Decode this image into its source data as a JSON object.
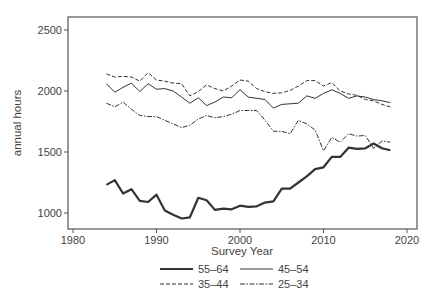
{
  "chart_data": {
    "type": "line",
    "title": "",
    "xlabel": "Survey Year",
    "ylabel": "annual hours",
    "xlim": [
      1979.4,
      2021.2
    ],
    "ylim": [
      900,
      2610
    ],
    "xticks": [
      1980,
      1990,
      2000,
      2010,
      2020
    ],
    "yticks": [
      1000,
      1500,
      2000,
      2500
    ],
    "grid": false,
    "legend_position": "bottom",
    "x": [
      1984,
      1985,
      1986,
      1987,
      1988,
      1989,
      1990,
      1991,
      1992,
      1993,
      1994,
      1995,
      1996,
      1997,
      1998,
      1999,
      2000,
      2001,
      2002,
      2003,
      2004,
      2005,
      2006,
      2007,
      2008,
      2009,
      2010,
      2011,
      2012,
      2013,
      2014,
      2015,
      2016,
      2017,
      2018
    ],
    "series": [
      {
        "name": "55–64",
        "style": "solid-thick",
        "values": [
          1230,
          1270,
          1160,
          1195,
          1100,
          1090,
          1150,
          1020,
          985,
          955,
          965,
          1125,
          1105,
          1025,
          1035,
          1030,
          1060,
          1050,
          1055,
          1085,
          1095,
          1200,
          1200,
          1250,
          1300,
          1360,
          1375,
          1460,
          1460,
          1535,
          1525,
          1530,
          1570,
          1530,
          1515
        ]
      },
      {
        "name": "45–54",
        "style": "solid-thin",
        "values": [
          2060,
          1990,
          2030,
          2065,
          1995,
          2060,
          2015,
          2020,
          2000,
          1950,
          1900,
          1945,
          1880,
          1910,
          1950,
          1945,
          2010,
          1950,
          1940,
          1930,
          1860,
          1890,
          1895,
          1900,
          1960,
          1940,
          1980,
          2010,
          1980,
          1940,
          1960,
          1950,
          1930,
          1920,
          1905
        ]
      },
      {
        "name": "35–44",
        "style": "dashed",
        "values": [
          2140,
          2115,
          2120,
          2115,
          2080,
          2150,
          2090,
          2080,
          2065,
          2060,
          1960,
          1995,
          2050,
          2020,
          2000,
          2040,
          2090,
          2080,
          2020,
          1995,
          1980,
          1985,
          2005,
          2040,
          2085,
          2085,
          2040,
          2070,
          2000,
          1975,
          1965,
          1930,
          1920,
          1890,
          1870
        ]
      },
      {
        "name": "25–34",
        "style": "dash-dot",
        "values": [
          1900,
          1870,
          1910,
          1850,
          1800,
          1790,
          1790,
          1760,
          1730,
          1700,
          1720,
          1770,
          1800,
          1780,
          1790,
          1810,
          1840,
          1840,
          1840,
          1760,
          1670,
          1670,
          1650,
          1760,
          1730,
          1680,
          1510,
          1620,
          1580,
          1650,
          1630,
          1635,
          1530,
          1590,
          1580
        ]
      }
    ]
  },
  "colors": {
    "line": "#333333",
    "axis": "#555555",
    "text": "#444444"
  }
}
